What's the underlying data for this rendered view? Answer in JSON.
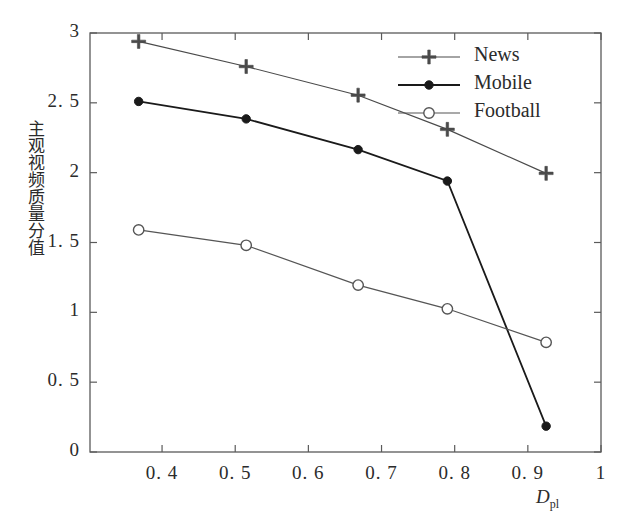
{
  "chart_data": {
    "type": "line",
    "title": "",
    "xlabel": "D_pl",
    "xlabel_main": "D",
    "xlabel_sub": "pl",
    "ylabel": "主观视频质量分值",
    "xlim": [
      0.3015,
      1.0
    ],
    "ylim": [
      0,
      3
    ],
    "xticks": [
      0.4,
      0.5,
      0.6,
      0.7,
      0.8,
      0.9,
      1.0
    ],
    "xtick_labels": [
      "0. 4",
      "0. 5",
      "0. 6",
      "0. 7",
      "0. 8",
      "0. 9",
      "1"
    ],
    "yticks": [
      0,
      0.5,
      1,
      1.5,
      2,
      2.5,
      3
    ],
    "ytick_labels": [
      "0",
      "0. 5",
      "1",
      "1. 5",
      "2",
      "2. 5",
      "3"
    ],
    "grid": false,
    "legend_position": "top-right",
    "x": [
      0.368,
      0.515,
      0.668,
      0.79,
      0.925
    ],
    "series": [
      {
        "name": "News",
        "marker": "star",
        "color": "#4a4a4a",
        "values": [
          2.94,
          2.76,
          2.555,
          2.31,
          1.995
        ]
      },
      {
        "name": "Mobile",
        "marker": "filled-circle",
        "color": "#1a1a1a",
        "values": [
          2.51,
          2.385,
          2.165,
          1.94,
          0.185
        ]
      },
      {
        "name": "Football",
        "marker": "open-circle",
        "color": "#555555",
        "values": [
          1.59,
          1.48,
          1.195,
          1.025,
          0.785
        ]
      }
    ]
  },
  "legend": {
    "entries": [
      {
        "label": "News"
      },
      {
        "label": "Mobile"
      },
      {
        "label": "Football"
      }
    ]
  },
  "axes": {
    "frame_color": "#5a5a5a"
  }
}
